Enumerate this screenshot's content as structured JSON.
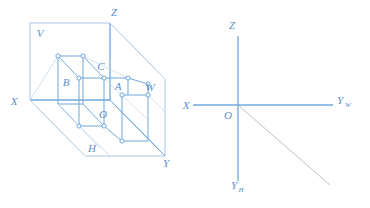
{
  "figure": {
    "background_color": "#ffffff",
    "line_color_primary": "#6fa8dc",
    "line_color_secondary": "#a8c4dd",
    "label_color": "#5b8fc9",
    "vertex_marker": "small-open-circle"
  },
  "left_diagram": {
    "name": "three-projection-plane-box",
    "description": "Open box formed by three mutually perpendicular projection planes containing a wireframe rectangular solid",
    "plane_labels": [
      {
        "id": "V",
        "text": "V",
        "x": 40,
        "y": 37,
        "meaning": "frontal-projection-plane"
      },
      {
        "id": "H",
        "text": "H",
        "x": 92,
        "y": 152,
        "meaning": "horizontal-projection-plane"
      },
      {
        "id": "W",
        "text": "W",
        "x": 150,
        "y": 91,
        "meaning": "profile-projection-plane"
      }
    ],
    "axis_labels": [
      {
        "id": "X",
        "text": "X",
        "x": 14,
        "y": 105
      },
      {
        "id": "Y",
        "text": "Y",
        "x": 166,
        "y": 167
      },
      {
        "id": "Z",
        "text": "Z",
        "x": 114,
        "y": 16
      }
    ],
    "point_labels": [
      {
        "id": "A",
        "text": "A",
        "x": 118,
        "y": 90
      },
      {
        "id": "B",
        "text": "B",
        "x": 66,
        "y": 86
      },
      {
        "id": "C",
        "text": "C",
        "x": 101,
        "y": 70
      },
      {
        "id": "O",
        "text": "O",
        "x": 103,
        "y": 118
      }
    ],
    "vertices": [
      {
        "name": "v-top-back-left",
        "x": 58,
        "y": 56
      },
      {
        "name": "v-top-back-right",
        "x": 83,
        "y": 56
      },
      {
        "name": "v-top-front-left",
        "x": 79,
        "y": 78
      },
      {
        "name": "v-top-front-right",
        "x": 104,
        "y": 78
      },
      {
        "name": "v-top-right-far",
        "x": 128,
        "y": 78
      },
      {
        "name": "v-mid-right",
        "x": 148,
        "y": 84
      },
      {
        "name": "v-front-right-low",
        "x": 122,
        "y": 95
      },
      {
        "name": "v-bottom-left",
        "x": 79,
        "y": 126
      },
      {
        "name": "v-bottom-mid",
        "x": 104,
        "y": 126
      },
      {
        "name": "v-bottom-right",
        "x": 122,
        "y": 141
      }
    ]
  },
  "right_diagram": {
    "name": "unfolded-projection-axes",
    "description": "Two-dimensional unfolded axis system with origin O, axes X, Z, Y-sub-W, Y-sub-H and a 45 degree bisector line",
    "origin": {
      "label": "O",
      "x": 238,
      "y": 105,
      "label_x": 228,
      "label_y": 118
    },
    "axes": [
      {
        "id": "X",
        "base": "X",
        "subscript": "",
        "label_x": 186,
        "label_y": 108,
        "direction": "left"
      },
      {
        "id": "Z",
        "base": "Z",
        "subscript": "",
        "label_x": 232,
        "label_y": 28,
        "direction": "up"
      },
      {
        "id": "YW",
        "base": "Y",
        "subscript": "W",
        "label_x": 340,
        "label_y": 105,
        "direction": "right"
      },
      {
        "id": "YH",
        "base": "Y",
        "subscript": "H",
        "label_x": 236,
        "label_y": 189,
        "direction": "down"
      }
    ],
    "bisector": {
      "name": "forty-five-degree-bisector",
      "from_x": 238,
      "from_y": 105,
      "to_x": 330,
      "to_y": 185
    }
  }
}
